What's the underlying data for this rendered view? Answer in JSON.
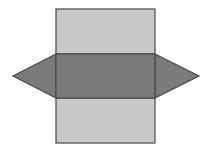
{
  "diagram": {
    "title": "",
    "colors": {
      "background": "#ffffff",
      "rect_face": "#c8c8c8",
      "middle_face": "#7a7a7a",
      "triangle_face": "#7a7a7a",
      "stroke": "#4a4a4a"
    },
    "shapes": {
      "top_rect": {
        "x": 56,
        "y": 9,
        "w": 99,
        "h": 45
      },
      "middle_rect": {
        "x": 56,
        "y": 54,
        "w": 99,
        "h": 44
      },
      "bottom_rect": {
        "x": 56,
        "y": 98,
        "w": 99,
        "h": 45
      },
      "left_triangle": {
        "points": "56,54 13,76 56,98"
      },
      "right_triangle": {
        "points": "155,54 199,76 155,98"
      }
    }
  }
}
